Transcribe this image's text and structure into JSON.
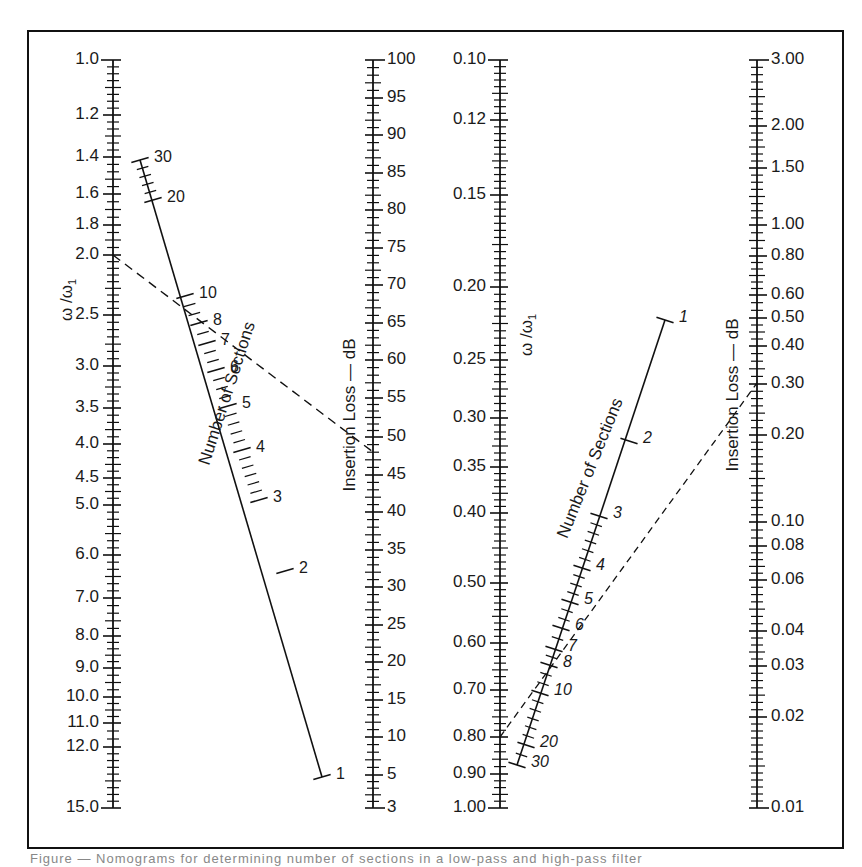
{
  "chart_data": {
    "type": "nomogram",
    "title": "",
    "panels": [
      {
        "name": "left",
        "scales": [
          {
            "id": "freq_ratio_left",
            "label": "ω / ω1",
            "x": 113,
            "ticks": [
              {
                "v": "1.0",
                "y": 60
              },
              {
                "v": "1.2",
                "y": 115
              },
              {
                "v": "1.4",
                "y": 157
              },
              {
                "v": "1.6",
                "y": 194
              },
              {
                "v": "1.8",
                "y": 225
              },
              {
                "v": "2.0",
                "y": 255
              },
              {
                "v": "2.5",
                "y": 315
              },
              {
                "v": "3.0",
                "y": 366
              },
              {
                "v": "3.5",
                "y": 408
              },
              {
                "v": "4.0",
                "y": 444
              },
              {
                "v": "4.5",
                "y": 478
              },
              {
                "v": "5.0",
                "y": 505
              },
              {
                "v": "6.0",
                "y": 555
              },
              {
                "v": "7.0",
                "y": 598
              },
              {
                "v": "8.0",
                "y": 636
              },
              {
                "v": "9.0",
                "y": 668
              },
              {
                "v": "10.0",
                "y": 697
              },
              {
                "v": "11.0",
                "y": 723
              },
              {
                "v": "12.0",
                "y": 747
              },
              {
                "v": "15.0",
                "y": 808
              }
            ]
          },
          {
            "id": "sections_left",
            "label": "Number of Sections",
            "ticks": [
              {
                "v": "30",
                "x": 140,
                "y": 160
              },
              {
                "v": "20",
                "x": 153,
                "y": 200
              },
              {
                "v": "10",
                "x": 185,
                "y": 296
              },
              {
                "v": "8",
                "x": 199,
                "y": 323
              },
              {
                "v": "7",
                "x": 207,
                "y": 343
              },
              {
                "v": "6",
                "x": 216,
                "y": 370
              },
              {
                "v": "5",
                "x": 228,
                "y": 406
              },
              {
                "v": "4",
                "x": 242,
                "y": 450
              },
              {
                "v": "3",
                "x": 259,
                "y": 500
              },
              {
                "v": "2",
                "x": 285,
                "y": 571
              },
              {
                "v": "1",
                "x": 322,
                "y": 777
              }
            ]
          },
          {
            "id": "insertion_loss_left",
            "label": "Insertion Loss — dB",
            "x": 373,
            "ticks": [
              {
                "v": "100",
                "y": 60
              },
              {
                "v": "95",
                "y": 98
              },
              {
                "v": "90",
                "y": 135
              },
              {
                "v": "85",
                "y": 173
              },
              {
                "v": "80",
                "y": 210
              },
              {
                "v": "75",
                "y": 248
              },
              {
                "v": "70",
                "y": 285
              },
              {
                "v": "65",
                "y": 323
              },
              {
                "v": "60",
                "y": 360
              },
              {
                "v": "55",
                "y": 398
              },
              {
                "v": "50",
                "y": 437
              },
              {
                "v": "45",
                "y": 475
              },
              {
                "v": "40",
                "y": 512
              },
              {
                "v": "35",
                "y": 550
              },
              {
                "v": "30",
                "y": 587
              },
              {
                "v": "25",
                "y": 625
              },
              {
                "v": "20",
                "y": 662
              },
              {
                "v": "15",
                "y": 700
              },
              {
                "v": "10",
                "y": 737
              },
              {
                "v": "5",
                "y": 775
              },
              {
                "v": "3",
                "y": 808
              }
            ]
          }
        ],
        "example_line": {
          "from": {
            "scale": "ω/ω1",
            "value": "2.0"
          },
          "via": {
            "scale": "sections",
            "value": "≈8"
          },
          "to": {
            "scale": "insertion loss",
            "value": "≈48 dB"
          }
        }
      },
      {
        "name": "right",
        "scales": [
          {
            "id": "freq_ratio_right",
            "label": "ω / ω1",
            "x": 500,
            "ticks": [
              {
                "v": "0.10",
                "y": 60
              },
              {
                "v": "0.12",
                "y": 120
              },
              {
                "v": "0.15",
                "y": 195
              },
              {
                "v": "0.20",
                "y": 287
              },
              {
                "v": "0.25",
                "y": 360
              },
              {
                "v": "0.30",
                "y": 418
              },
              {
                "v": "0.35",
                "y": 467
              },
              {
                "v": "0.40",
                "y": 513
              },
              {
                "v": "0.50",
                "y": 583
              },
              {
                "v": "0.60",
                "y": 643
              },
              {
                "v": "0.70",
                "y": 690
              },
              {
                "v": "0.80",
                "y": 737
              },
              {
                "v": "0.90",
                "y": 774
              },
              {
                "v": "1.00",
                "y": 808
              }
            ]
          },
          {
            "id": "sections_right",
            "label": "Number of Sections",
            "ticks": [
              {
                "v": "1",
                "x": 665,
                "y": 320
              },
              {
                "v": "2",
                "x": 629,
                "y": 441
              },
              {
                "v": "3",
                "x": 599,
                "y": 516
              },
              {
                "v": "4",
                "x": 582,
                "y": 568
              },
              {
                "v": "5",
                "x": 570,
                "y": 602
              },
              {
                "v": "6",
                "x": 561,
                "y": 628
              },
              {
                "v": "7",
                "x": 554,
                "y": 649
              },
              {
                "v": "8",
                "x": 549,
                "y": 665
              },
              {
                "v": "10",
                "x": 540,
                "y": 693
              },
              {
                "v": "20",
                "x": 526,
                "y": 745
              },
              {
                "v": "30",
                "x": 517,
                "y": 765
              }
            ]
          },
          {
            "id": "insertion_loss_right",
            "label": "Insertion Loss — dB",
            "x": 757,
            "ticks": [
              {
                "v": "3.00",
                "y": 60
              },
              {
                "v": "2.00",
                "y": 126
              },
              {
                "v": "1.50",
                "y": 168
              },
              {
                "v": "1.00",
                "y": 225
              },
              {
                "v": "0.80",
                "y": 256
              },
              {
                "v": "0.60",
                "y": 295
              },
              {
                "v": "0.50",
                "y": 318
              },
              {
                "v": "0.40",
                "y": 346
              },
              {
                "v": "0.30",
                "y": 384
              },
              {
                "v": "0.20",
                "y": 435
              },
              {
                "v": "0.10",
                "y": 522
              },
              {
                "v": "0.08",
                "y": 546
              },
              {
                "v": "0.06",
                "y": 580
              },
              {
                "v": "0.04",
                "y": 631
              },
              {
                "v": "0.03",
                "y": 666
              },
              {
                "v": "0.02",
                "y": 717
              },
              {
                "v": "0.01",
                "y": 808
              }
            ]
          }
        ],
        "example_line": {
          "from": {
            "scale": "ω/ω1",
            "value": "≈0.80"
          },
          "via": {
            "scale": "sections",
            "value": "≈7"
          },
          "to": {
            "scale": "insertion loss",
            "value": "≈0.33 dB"
          }
        }
      }
    ],
    "grid": false,
    "legend": null
  },
  "labels": {
    "left_freq_axis": "ω /ω",
    "left_freq_sub": "1",
    "right_freq_axis": "ω /ω",
    "right_freq_sub": "1",
    "left_sections": "Number of Sections",
    "right_sections": "Number of Sections",
    "left_insertion": "Insertion Loss — dB",
    "right_insertion": "Insertion Loss — dB"
  },
  "caption": "Figure — Nomograms for determining number of sections in a low-pass and high-pass filter"
}
